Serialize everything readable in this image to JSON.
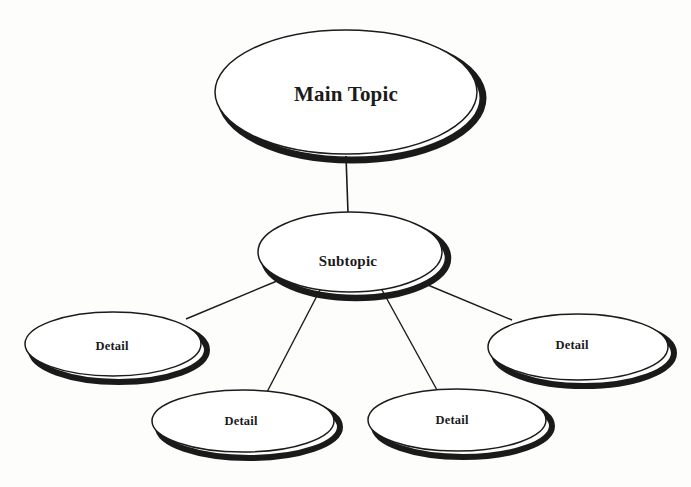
{
  "diagram": {
    "type": "mind-map",
    "background_color": "#fdfdfb",
    "outline_color": "#1b1b1b",
    "shadow_color": "#1a1a1a",
    "text_color": "#1b1b1b",
    "nodes": [
      {
        "id": "main-topic",
        "label": "Main Topic",
        "level": "root",
        "cx": 346,
        "cy": 92,
        "rx": 131,
        "ry": 62
      },
      {
        "id": "subtopic",
        "label": "Subtopic",
        "level": "branch",
        "cx": 350,
        "cy": 252,
        "rx": 92,
        "ry": 40
      },
      {
        "id": "detail-left",
        "label": "Detail",
        "level": "leaf",
        "cx": 113,
        "cy": 344,
        "rx": 88,
        "ry": 32
      },
      {
        "id": "detail-bottom-left",
        "label": "Detail",
        "level": "leaf",
        "cx": 243,
        "cy": 421,
        "rx": 91,
        "ry": 31
      },
      {
        "id": "detail-bottom-right",
        "label": "Detail",
        "level": "leaf",
        "cx": 457,
        "cy": 420,
        "rx": 89,
        "ry": 31
      },
      {
        "id": "detail-right",
        "label": "Detail",
        "level": "leaf",
        "cx": 578,
        "cy": 347,
        "rx": 90,
        "ry": 33
      }
    ],
    "connectors": [
      {
        "id": "main-to-subtopic",
        "from": "main-topic",
        "to": "subtopic",
        "x1": 346,
        "y1": 156,
        "x2": 348,
        "y2": 213
      },
      {
        "id": "subtopic-to-detail-left",
        "from": "subtopic",
        "to": "detail-left",
        "x1": 277,
        "y1": 281,
        "x2": 186,
        "y2": 319
      },
      {
        "id": "subtopic-to-detail-bottom-left",
        "from": "subtopic",
        "to": "detail-bottom-left",
        "x1": 320,
        "y1": 290,
        "x2": 267,
        "y2": 392
      },
      {
        "id": "subtopic-to-detail-bottom-right",
        "from": "subtopic",
        "to": "detail-bottom-right",
        "x1": 382,
        "y1": 290,
        "x2": 437,
        "y2": 390
      },
      {
        "id": "subtopic-to-detail-right",
        "from": "subtopic",
        "to": "detail-right",
        "x1": 423,
        "y1": 283,
        "x2": 512,
        "y2": 320
      }
    ]
  }
}
